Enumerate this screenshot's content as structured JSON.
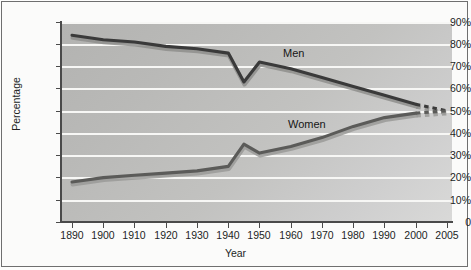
{
  "chart_data": {
    "type": "line",
    "title": "",
    "xlabel": "Year",
    "ylabel": "Percentage",
    "ylim": [
      0,
      90
    ],
    "ytick_labels": [
      "90%",
      "80%",
      "70%",
      "60%",
      "50%",
      "40%",
      "30%",
      "20%",
      "10%",
      "0"
    ],
    "ytick_values": [
      90,
      80,
      70,
      60,
      50,
      40,
      30,
      20,
      10,
      0
    ],
    "grid": "horizontal",
    "legend": "inline-labels",
    "categories": [
      "1890",
      "1900",
      "1910",
      "1920",
      "1930",
      "1940",
      "1945",
      "1950",
      "1960",
      "1970",
      "1980",
      "1990",
      "2000",
      "2005"
    ],
    "x": [
      1890,
      1900,
      1910,
      1920,
      1930,
      1940,
      1945,
      1950,
      1960,
      1970,
      1980,
      1990,
      2000,
      2005
    ],
    "xtick_labels": [
      "1890",
      "1900",
      "1910",
      "1920",
      "1930",
      "1940",
      "1950",
      "1960",
      "1970",
      "1980",
      "1990",
      "2000",
      "2005"
    ],
    "series": [
      {
        "name": "Men",
        "color": "#3a3a3a",
        "shadow_color": "#8e8e8c",
        "values": [
          84,
          82,
          81,
          79,
          78,
          76,
          63,
          72,
          69,
          65,
          61,
          57,
          53,
          50
        ],
        "dashed_from": "2000"
      },
      {
        "name": "Women",
        "color": "#5b5b59",
        "shadow_color": "#9a9a98",
        "values": [
          18,
          20,
          21,
          22,
          23,
          25,
          35,
          31,
          34,
          38,
          43,
          47,
          49,
          50
        ],
        "dashed_from": "2000"
      }
    ],
    "annotations": [
      {
        "text": "Men",
        "x": 1962,
        "y": 77
      },
      {
        "text": "Women",
        "x": 1964,
        "y": 44
      }
    ]
  },
  "axes": {
    "y_title": "Percentage",
    "x_title": "Year"
  }
}
